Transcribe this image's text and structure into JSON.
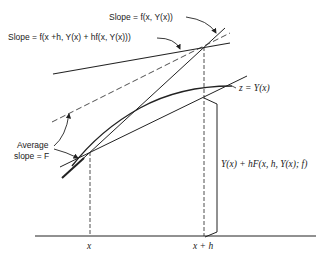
{
  "diagram": {
    "labels": {
      "slope_at_x": "Slope = f(x, Y(x))",
      "slope_at_xh": "Slope = f(x +h, Y(x) + hf(x, Y(x)))",
      "curve": "z = Y(x)",
      "average_line1": "Average",
      "average_line2": "slope = F",
      "increment": "Y(x) + hF(x, h, Y(x); f)",
      "x_tick": "x",
      "xh_tick": "x + h"
    },
    "colors": {
      "ink": "#222222",
      "background": "#ffffff"
    }
  }
}
